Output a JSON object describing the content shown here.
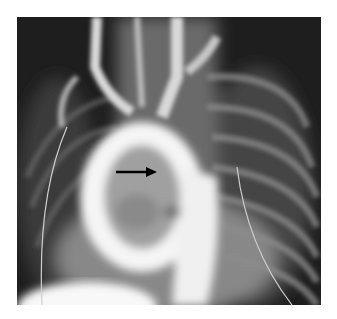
{
  "image": {
    "type": "radiograph",
    "description": "Chest angiogram showing contrast-filled aortic arch with an annotation arrow",
    "annotation": {
      "kind": "arrow",
      "direction": "right",
      "color": "#000000"
    }
  }
}
